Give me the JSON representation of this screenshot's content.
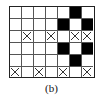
{
  "figure": {
    "caption": "(b)",
    "colors": {
      "filled": "#000000",
      "empty": "#ffffff",
      "grid_line": "#555555",
      "border": "#222222",
      "mark": "#333333",
      "background": "#ffffff"
    },
    "grid": {
      "columns": 7,
      "rows": 6,
      "cell_width": 12,
      "cell_height": 12,
      "legend": {
        "filled": "black-cell",
        "cross": "x-mark-cell",
        "empty": "empty-cell"
      },
      "cells": [
        [
          "empty",
          "empty",
          "empty",
          "empty",
          "empty",
          "filled",
          "empty"
        ],
        [
          "empty",
          "empty",
          "empty",
          "empty",
          "filled",
          "empty",
          "filled"
        ],
        [
          "empty",
          "cross",
          "empty",
          "cross",
          "empty",
          "cross",
          "cross"
        ],
        [
          "empty",
          "empty",
          "empty",
          "empty",
          "filled",
          "empty",
          "filled"
        ],
        [
          "empty",
          "empty",
          "empty",
          "empty",
          "empty",
          "filled",
          "empty"
        ],
        [
          "cross",
          "empty",
          "cross",
          "empty",
          "cross",
          "empty",
          "cross"
        ]
      ]
    }
  }
}
